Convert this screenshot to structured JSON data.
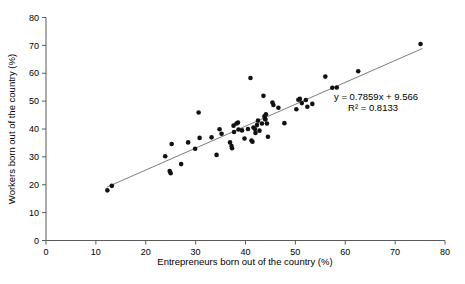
{
  "chart_data": {
    "type": "scatter",
    "title": "",
    "xlabel": "Entrepreneurs born out of the country (%)",
    "ylabel": "Workers born out of the country (%)",
    "xlim": [
      0,
      80
    ],
    "ylim": [
      0,
      80
    ],
    "xticks": [
      0,
      10,
      20,
      30,
      40,
      50,
      60,
      70,
      80
    ],
    "yticks": [
      0,
      10,
      20,
      30,
      40,
      50,
      60,
      70,
      80
    ],
    "grid": false,
    "legend": null,
    "point_color": "#111111",
    "trendline_color": "#6e6e6e",
    "annotations": {
      "equation": "y = 0.7859x + 9.566",
      "r_squared": "R² = 0.8133",
      "slope": 0.7859,
      "intercept": 9.566,
      "r2": 0.8133
    },
    "trendline": {
      "x": [
        12.2,
        75.5
      ],
      "y": [
        19.15,
        68.9
      ]
    },
    "points": [
      {
        "x": 12.3,
        "y": 18.0
      },
      {
        "x": 13.2,
        "y": 19.6
      },
      {
        "x": 23.9,
        "y": 30.2
      },
      {
        "x": 24.8,
        "y": 24.9
      },
      {
        "x": 25.0,
        "y": 24.1
      },
      {
        "x": 25.2,
        "y": 34.6
      },
      {
        "x": 27.1,
        "y": 27.4
      },
      {
        "x": 28.5,
        "y": 35.2
      },
      {
        "x": 29.9,
        "y": 32.9
      },
      {
        "x": 30.6,
        "y": 45.9
      },
      {
        "x": 30.8,
        "y": 36.8
      },
      {
        "x": 33.2,
        "y": 37.0
      },
      {
        "x": 34.2,
        "y": 30.7
      },
      {
        "x": 34.8,
        "y": 39.9
      },
      {
        "x": 35.2,
        "y": 38.3
      },
      {
        "x": 36.9,
        "y": 35.2
      },
      {
        "x": 37.2,
        "y": 33.9
      },
      {
        "x": 37.3,
        "y": 33.1
      },
      {
        "x": 37.6,
        "y": 41.2
      },
      {
        "x": 37.7,
        "y": 38.9
      },
      {
        "x": 38.2,
        "y": 42.0
      },
      {
        "x": 38.5,
        "y": 42.3
      },
      {
        "x": 38.6,
        "y": 39.8
      },
      {
        "x": 39.3,
        "y": 39.5
      },
      {
        "x": 39.8,
        "y": 36.6
      },
      {
        "x": 40.5,
        "y": 40.0
      },
      {
        "x": 41.0,
        "y": 58.3
      },
      {
        "x": 41.2,
        "y": 35.9
      },
      {
        "x": 41.4,
        "y": 35.4
      },
      {
        "x": 41.6,
        "y": 40.5
      },
      {
        "x": 41.9,
        "y": 40.0
      },
      {
        "x": 42.0,
        "y": 38.6
      },
      {
        "x": 42.3,
        "y": 41.4
      },
      {
        "x": 42.5,
        "y": 43.0
      },
      {
        "x": 42.8,
        "y": 39.4
      },
      {
        "x": 43.3,
        "y": 42.0
      },
      {
        "x": 43.6,
        "y": 51.9
      },
      {
        "x": 43.8,
        "y": 44.6
      },
      {
        "x": 43.9,
        "y": 43.7
      },
      {
        "x": 44.0,
        "y": 43.4
      },
      {
        "x": 44.1,
        "y": 45.3
      },
      {
        "x": 44.3,
        "y": 42.0
      },
      {
        "x": 44.5,
        "y": 37.2
      },
      {
        "x": 45.4,
        "y": 49.5
      },
      {
        "x": 45.6,
        "y": 48.6
      },
      {
        "x": 46.6,
        "y": 47.6
      },
      {
        "x": 47.8,
        "y": 42.1
      },
      {
        "x": 50.2,
        "y": 47.1
      },
      {
        "x": 50.6,
        "y": 50.5
      },
      {
        "x": 50.9,
        "y": 50.8
      },
      {
        "x": 51.3,
        "y": 49.3
      },
      {
        "x": 52.1,
        "y": 50.4
      },
      {
        "x": 52.4,
        "y": 48.0
      },
      {
        "x": 53.4,
        "y": 49.0
      },
      {
        "x": 56.0,
        "y": 58.8
      },
      {
        "x": 57.4,
        "y": 54.8
      },
      {
        "x": 58.3,
        "y": 54.9
      },
      {
        "x": 62.6,
        "y": 60.7
      },
      {
        "x": 75.1,
        "y": 70.5
      }
    ]
  },
  "axes": {
    "x_label": "Entrepreneurs born out of the country (%)",
    "y_label": "Workers born out of the country (%)",
    "x_tick_labels": [
      "0",
      "10",
      "20",
      "30",
      "40",
      "50",
      "60",
      "70",
      "80"
    ],
    "y_tick_labels": [
      "0",
      "10",
      "20",
      "30",
      "40",
      "50",
      "60",
      "70",
      "80"
    ]
  },
  "annotation": {
    "line1": "y = 0.7859x + 9.566",
    "line2": "R² = 0.8133"
  }
}
